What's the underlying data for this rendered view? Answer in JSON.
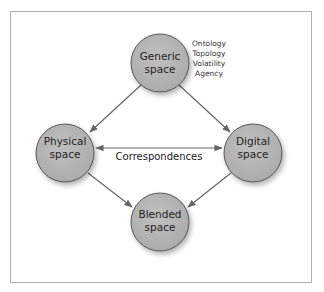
{
  "colors": {
    "node_fill": "#b5b5b5",
    "node_stroke": "#555555",
    "arrow": "#666666",
    "frame": "#b0b0b0",
    "background": "#ffffff"
  },
  "nodes": {
    "generic": {
      "line1": "Generic",
      "line2": "space"
    },
    "physical": {
      "line1": "Physical",
      "line2": "space"
    },
    "digital": {
      "line1": "Digital",
      "line2": "space"
    },
    "blended": {
      "line1": "Blended",
      "line2": "space"
    }
  },
  "generic_attributes": [
    "Ontology",
    "Topology",
    "Volatility",
    "Agency"
  ],
  "edges": {
    "correspondences_label": "Correspondences"
  }
}
